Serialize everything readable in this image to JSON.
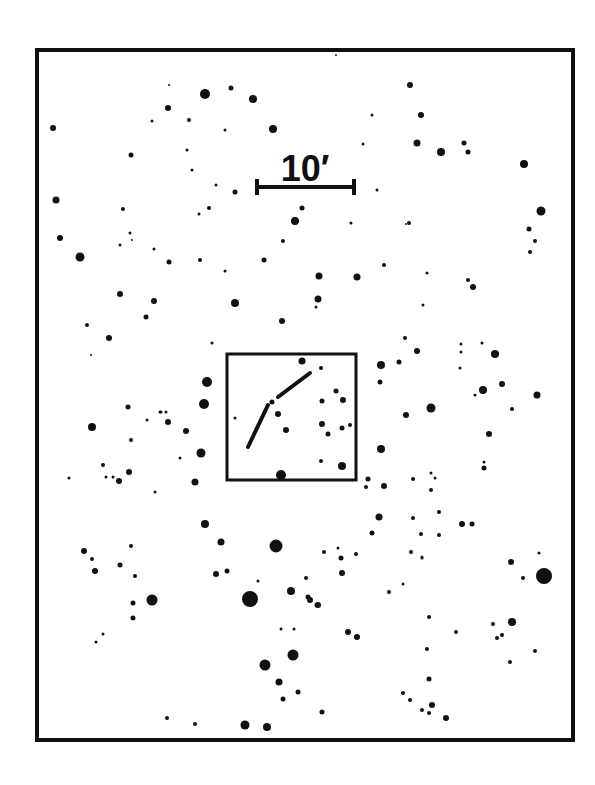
{
  "finder_chart": {
    "frame": {
      "x": 37,
      "y": 50,
      "width": 536,
      "height": 690,
      "stroke": "#111111",
      "stroke_width": 4
    },
    "scale_bar": {
      "label": "10′",
      "x1": 257,
      "x2": 354,
      "y": 187,
      "tick_half": 8,
      "label_x": 305,
      "label_y": 181
    },
    "field_box": {
      "x": 227,
      "y": 354,
      "width": 129,
      "height": 126,
      "stroke_width": 3
    },
    "track": {
      "description": "object path",
      "segments": [
        {
          "points": [
            [
              248,
              447
            ],
            [
              268,
              405
            ]
          ]
        },
        {
          "points": [
            [
              278,
              397
            ],
            [
              310,
              373
            ]
          ]
        }
      ]
    },
    "colors": {
      "ink": "#111111",
      "background": "#ffffff"
    }
  },
  "chart_data": {
    "type": "scatter",
    "title": "",
    "xlabel": "",
    "ylabel": "",
    "annotations": [
      "10′ scale bar",
      "central field box with object track"
    ],
    "stars": [
      [
        169,
        85,
        1
      ],
      [
        205,
        94,
        5
      ],
      [
        231,
        88,
        2.5
      ],
      [
        253,
        99,
        4
      ],
      [
        53,
        128,
        3
      ],
      [
        168,
        108,
        3
      ],
      [
        152,
        121,
        1.5
      ],
      [
        189,
        120,
        2
      ],
      [
        225,
        130,
        1.5
      ],
      [
        273,
        129,
        4
      ],
      [
        131,
        155,
        2.5
      ],
      [
        187,
        150,
        1.5
      ],
      [
        192,
        170,
        1.5
      ],
      [
        216,
        185,
        1.5
      ],
      [
        235,
        192,
        2.5
      ],
      [
        56,
        200,
        3.5
      ],
      [
        123,
        209,
        2
      ],
      [
        199,
        214,
        1.5
      ],
      [
        209,
        208,
        2
      ],
      [
        302,
        208,
        2.5
      ],
      [
        295,
        221,
        4
      ],
      [
        60,
        238,
        3
      ],
      [
        130,
        233,
        1.5
      ],
      [
        132,
        240,
        1
      ],
      [
        80,
        257,
        4.5
      ],
      [
        120,
        245,
        1.5
      ],
      [
        154,
        249,
        1.5
      ],
      [
        169,
        262,
        2.5
      ],
      [
        200,
        260,
        2
      ],
      [
        225,
        271,
        1.5
      ],
      [
        264,
        260,
        2.5
      ],
      [
        283,
        241,
        2
      ],
      [
        336,
        55,
        0
      ],
      [
        410,
        85,
        3
      ],
      [
        421,
        115,
        3
      ],
      [
        372,
        115,
        1.5
      ],
      [
        363,
        144,
        1.5
      ],
      [
        417,
        143,
        3.5
      ],
      [
        441,
        152,
        4
      ],
      [
        464,
        143,
        2.5
      ],
      [
        468,
        152,
        2.5
      ],
      [
        524,
        164,
        4
      ],
      [
        377,
        190,
        1.5
      ],
      [
        541,
        211,
        4.5
      ],
      [
        351,
        223,
        1.5
      ],
      [
        409,
        223,
        2
      ],
      [
        406,
        224,
        1
      ],
      [
        529,
        229,
        2.5
      ],
      [
        535,
        241,
        2
      ],
      [
        120,
        294,
        3
      ],
      [
        154,
        301,
        3
      ],
      [
        146,
        317,
        2.5
      ],
      [
        235,
        303,
        4
      ],
      [
        87,
        325,
        2
      ],
      [
        109,
        338,
        3
      ],
      [
        91,
        355,
        1
      ],
      [
        212,
        343,
        1.5
      ],
      [
        282,
        321,
        3
      ],
      [
        319,
        276,
        3.5
      ],
      [
        357,
        277,
        3.5
      ],
      [
        384,
        265,
        2
      ],
      [
        427,
        273,
        1.5
      ],
      [
        318,
        299,
        3.5
      ],
      [
        316,
        307,
        1.5
      ],
      [
        423,
        305,
        1.5
      ],
      [
        468,
        280,
        2
      ],
      [
        473,
        287,
        3
      ],
      [
        405,
        338,
        2
      ],
      [
        417,
        351,
        3
      ],
      [
        461,
        344,
        1.5
      ],
      [
        461,
        352,
        1.5
      ],
      [
        482,
        343,
        1.5
      ],
      [
        495,
        354,
        4
      ],
      [
        460,
        368,
        1.5
      ],
      [
        381,
        365,
        4
      ],
      [
        380,
        382,
        2.5
      ],
      [
        399,
        362,
        2.5
      ],
      [
        431,
        408,
        4.5
      ],
      [
        483,
        390,
        4
      ],
      [
        502,
        384,
        3
      ],
      [
        537,
        395,
        3.5
      ],
      [
        475,
        395,
        1.5
      ],
      [
        406,
        415,
        3
      ],
      [
        381,
        449,
        4
      ],
      [
        489,
        434,
        3
      ],
      [
        484,
        468,
        2.5
      ],
      [
        484,
        462,
        1.5
      ],
      [
        435,
        478,
        1.5
      ],
      [
        512,
        409,
        2
      ],
      [
        207,
        382,
        5
      ],
      [
        204,
        404,
        5
      ],
      [
        128,
        407,
        2.5
      ],
      [
        160,
        412,
        1.5
      ],
      [
        166,
        412,
        1.5
      ],
      [
        168,
        422,
        3
      ],
      [
        186,
        431,
        3
      ],
      [
        92,
        427,
        4
      ],
      [
        131,
        440,
        2
      ],
      [
        147,
        420,
        1.5
      ],
      [
        161,
        412,
        1.5
      ],
      [
        201,
        453,
        4.5
      ],
      [
        180,
        458,
        1.5
      ],
      [
        195,
        482,
        3.5
      ],
      [
        103,
        465,
        2
      ],
      [
        106,
        477,
        1.5
      ],
      [
        113,
        477,
        1.5
      ],
      [
        119,
        481,
        3
      ],
      [
        129,
        472,
        3
      ],
      [
        69,
        478,
        1.5
      ],
      [
        155,
        492,
        1.5
      ],
      [
        205,
        524,
        4
      ],
      [
        221,
        542,
        3.5
      ],
      [
        276,
        546,
        6.5
      ],
      [
        84,
        551,
        3
      ],
      [
        92,
        559,
        2
      ],
      [
        95,
        571,
        3
      ],
      [
        131,
        546,
        2
      ],
      [
        120,
        565,
        2.5
      ],
      [
        135,
        576,
        2
      ],
      [
        216,
        574,
        3
      ],
      [
        227,
        571,
        2.5
      ],
      [
        258,
        581,
        1.5
      ],
      [
        152,
        600,
        5.5
      ],
      [
        133,
        603,
        2.5
      ],
      [
        133,
        618,
        2.5
      ],
      [
        103,
        634,
        1.5
      ],
      [
        96,
        642,
        1.5
      ],
      [
        250,
        599,
        8
      ],
      [
        291,
        591,
        4
      ],
      [
        308,
        597,
        2.5
      ],
      [
        317,
        605,
        2.5
      ],
      [
        281,
        629,
        1.5
      ],
      [
        294,
        629,
        1.5
      ],
      [
        265,
        665,
        5.5
      ],
      [
        293,
        655,
        5.5
      ],
      [
        279,
        682,
        3.5
      ],
      [
        298,
        692,
        2.5
      ],
      [
        283,
        699,
        2.5
      ],
      [
        167,
        718,
        2
      ],
      [
        195,
        724,
        2
      ],
      [
        245,
        725,
        4.5
      ],
      [
        267,
        727,
        4
      ],
      [
        322,
        712,
        2.5
      ],
      [
        422,
        710,
        2
      ],
      [
        429,
        713,
        2
      ],
      [
        446,
        718,
        3
      ],
      [
        384,
        486,
        3
      ],
      [
        368,
        479,
        2.5
      ],
      [
        366,
        487,
        2
      ],
      [
        379,
        517,
        3.5
      ],
      [
        431,
        473,
        1.5
      ],
      [
        413,
        479,
        2
      ],
      [
        431,
        490,
        2
      ],
      [
        439,
        512,
        2
      ],
      [
        462,
        524,
        3
      ],
      [
        472,
        524,
        2.5
      ],
      [
        413,
        518,
        2
      ],
      [
        421,
        534,
        2
      ],
      [
        411,
        552,
        2
      ],
      [
        422,
        557,
        1.5
      ],
      [
        439,
        535,
        2
      ],
      [
        324,
        552,
        2
      ],
      [
        338,
        548,
        1.5
      ],
      [
        372,
        533,
        2.5
      ],
      [
        341,
        558,
        2.5
      ],
      [
        342,
        573,
        3
      ],
      [
        356,
        554,
        2
      ],
      [
        422,
        558,
        1.5
      ],
      [
        511,
        562,
        3
      ],
      [
        539,
        553,
        1.5
      ],
      [
        544,
        576,
        8
      ],
      [
        523,
        578,
        2
      ],
      [
        306,
        578,
        2
      ],
      [
        310,
        600,
        3
      ],
      [
        318,
        605,
        3
      ],
      [
        389,
        592,
        2
      ],
      [
        403,
        584,
        1.5
      ],
      [
        429,
        617,
        2
      ],
      [
        456,
        632,
        2
      ],
      [
        493,
        624,
        2
      ],
      [
        512,
        622,
        4
      ],
      [
        497,
        638,
        2
      ],
      [
        502,
        635,
        2
      ],
      [
        535,
        651,
        2
      ],
      [
        510,
        662,
        2
      ],
      [
        348,
        632,
        3
      ],
      [
        357,
        637,
        3
      ],
      [
        427,
        649,
        2
      ],
      [
        429,
        679,
        2.5
      ],
      [
        403,
        693,
        2
      ],
      [
        410,
        700,
        2
      ],
      [
        432,
        705,
        3
      ],
      [
        530,
        252,
        2
      ]
    ],
    "field_box_stars": [
      [
        302,
        361,
        3.5
      ],
      [
        321,
        368,
        2
      ],
      [
        272,
        402,
        2.5
      ],
      [
        278,
        414,
        3
      ],
      [
        286,
        430,
        3
      ],
      [
        235,
        418,
        1.5
      ],
      [
        322,
        401,
        2.5
      ],
      [
        336,
        391,
        2.5
      ],
      [
        343,
        400,
        3
      ],
      [
        322,
        424,
        3
      ],
      [
        328,
        434,
        2.5
      ],
      [
        342,
        428,
        2.5
      ],
      [
        350,
        425,
        2
      ],
      [
        321,
        461,
        2
      ],
      [
        342,
        466,
        4
      ],
      [
        281,
        475,
        5
      ]
    ]
  }
}
